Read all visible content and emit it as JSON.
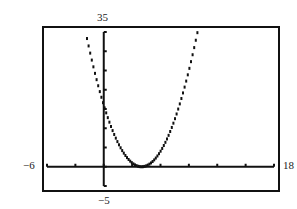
{
  "chart_data": {
    "type": "line",
    "title": "",
    "xlabel": "",
    "ylabel": "",
    "xlim": [
      -6,
      18
    ],
    "ylim": [
      -5,
      35
    ],
    "x_tick_step": 3,
    "y_tick_step": 5,
    "grid": false,
    "series": [
      {
        "name": "y = (x - 4)^2",
        "function": "(x-4)^2",
        "x": [
          -2,
          -1,
          0,
          1,
          2,
          3,
          4,
          5,
          6,
          7,
          8,
          9,
          10
        ],
        "y": [
          36,
          25,
          16,
          9,
          4,
          1,
          0,
          1,
          4,
          9,
          16,
          25,
          36
        ]
      }
    ]
  },
  "labels": {
    "ymax": "35",
    "ymin": "−5",
    "xmin": "−6",
    "xmax": "18"
  }
}
